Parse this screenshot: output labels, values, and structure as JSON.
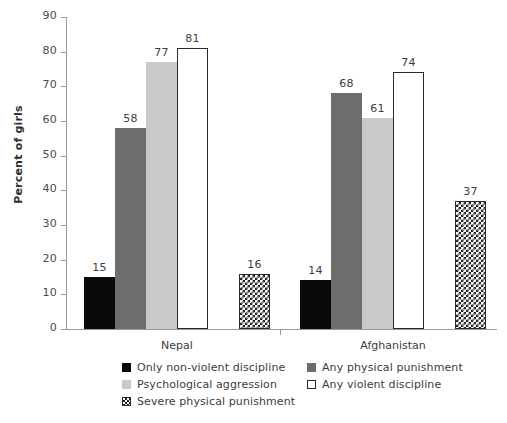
{
  "chart_data": {
    "type": "bar",
    "title": "",
    "xlabel": "",
    "ylabel": "Percent of girls",
    "ylim": [
      0,
      90
    ],
    "ytick_step": 10,
    "yticks": [
      90,
      80,
      70,
      60,
      50,
      40,
      30,
      20,
      10,
      0
    ],
    "grid": false,
    "legend_position": "bottom",
    "categories": [
      "Nepal",
      "Afghanistan"
    ],
    "series": [
      {
        "name": "Only non-violent discipline",
        "swatch": "black",
        "color": "#0a0a0a",
        "values": [
          15,
          14
        ]
      },
      {
        "name": "Any physical punishment",
        "swatch": "dark-gray",
        "color": "#6d6d6d",
        "values": [
          58,
          68
        ]
      },
      {
        "name": "Psychological aggression",
        "swatch": "light-gray",
        "color": "#c9c9c9",
        "values": [
          77,
          61
        ]
      },
      {
        "name": "Any violent discipline",
        "swatch": "white-outline",
        "color": "#ffffff",
        "values": [
          81,
          74
        ]
      },
      {
        "name": "Severe physical punishment",
        "swatch": "checkered",
        "color": "#ffffff",
        "values": [
          16,
          37
        ]
      }
    ]
  }
}
